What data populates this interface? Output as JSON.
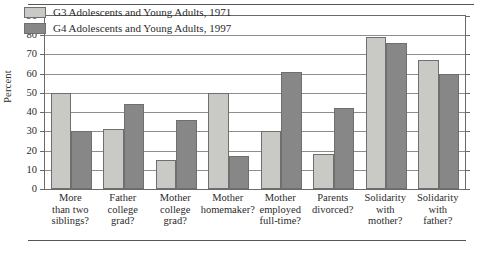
{
  "chart_data": {
    "type": "bar",
    "title": "",
    "xlabel": "",
    "ylabel": "Percent",
    "ylim": [
      0,
      90
    ],
    "ytick_step": 10,
    "yticks": [
      0,
      10,
      20,
      30,
      40,
      50,
      60,
      70,
      80,
      90
    ],
    "grid": true,
    "legend_position": "top-left-inside",
    "categories": [
      "More than two siblings?",
      "Father college grad?",
      "Mother college grad?",
      "Mother homemaker?",
      "Mother employed full-time?",
      "Parents divorced?",
      "Solidarity with mother?",
      "Solidarity with father?"
    ],
    "category_lines": [
      [
        "More",
        "than two",
        "siblings?"
      ],
      [
        "Father",
        "college",
        "grad?"
      ],
      [
        "Mother",
        "college",
        "grad?"
      ],
      [
        "Mother",
        "homemaker?"
      ],
      [
        "Mother",
        "employed",
        "full-time?"
      ],
      [
        "Parents",
        "divorced?"
      ],
      [
        "Solidarity",
        "with",
        "mother?"
      ],
      [
        "Solidarity",
        "with",
        "father?"
      ]
    ],
    "series": [
      {
        "name": "G3 Adolescents and Young Adults, 1971",
        "color": "#c9c9c5",
        "values": [
          50,
          31,
          15,
          50,
          30,
          18,
          79,
          67
        ]
      },
      {
        "name": "G4 Adolescents and Young Adults, 1997",
        "color": "#878787",
        "values": [
          30,
          44,
          36,
          17,
          61,
          42,
          76,
          60
        ]
      }
    ]
  },
  "legend": {
    "items": [
      {
        "label": "G3 Adolescents and Young Adults, 1971",
        "swatch": "light-gray-swatch"
      },
      {
        "label": "G4 Adolescents and Young Adults, 1997",
        "swatch": "dark-gray-swatch"
      }
    ]
  },
  "axis": {
    "y_title": "Percent",
    "y_tick_labels": [
      "90",
      "80",
      "70",
      "60",
      "50",
      "40",
      "30",
      "20",
      "10",
      "0"
    ]
  },
  "colors": {
    "series_1": "#c9c9c5",
    "series_2": "#878787",
    "axis": "#6a6a6a",
    "grid": "#8d8d8d",
    "rule": "#55555a",
    "text": "#2b2b2b",
    "background": "#ffffff"
  }
}
